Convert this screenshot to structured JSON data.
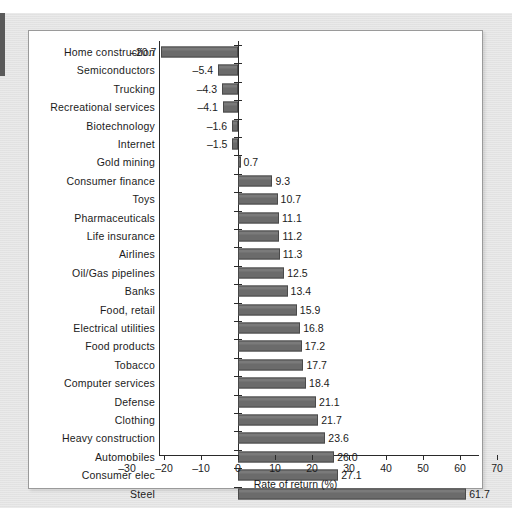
{
  "chart_data": {
    "type": "bar",
    "orientation": "horizontal",
    "title": "",
    "xlabel": "Rate of return (%)",
    "ylabel": "",
    "xlim": [
      -30,
      70
    ],
    "xticks": [
      -30,
      -20,
      -10,
      0,
      10,
      20,
      30,
      40,
      50,
      60,
      70
    ],
    "xtick_labels": [
      "–30",
      "–20",
      "–10",
      "0",
      "10",
      "20",
      "30",
      "40",
      "50",
      "60",
      "70"
    ],
    "grid": false,
    "legend": null,
    "bar_color": "#6b6b6b",
    "categories": [
      "Home construction",
      "Semiconductors",
      "Trucking",
      "Recreational services",
      "Biotechnology",
      "Internet",
      "Gold mining",
      "Consumer finance",
      "Toys",
      "Pharmaceuticals",
      "Life insurance",
      "Airlines",
      "Oil/Gas pipelines",
      "Banks",
      "Food, retail",
      "Electrical utilities",
      "Food products",
      "Tobacco",
      "Computer services",
      "Defense",
      "Clothing",
      "Heavy construction",
      "Automobiles",
      "Consumer elec",
      "Steel"
    ],
    "values": [
      -20.7,
      -5.4,
      -4.3,
      -4.1,
      -1.6,
      -1.5,
      0.7,
      9.3,
      10.7,
      11.1,
      11.2,
      11.3,
      12.5,
      13.4,
      15.9,
      16.8,
      17.2,
      17.7,
      18.4,
      21.1,
      21.7,
      23.6,
      26.0,
      27.1,
      61.7
    ],
    "value_labels": [
      "–20.7",
      "–5.4",
      "–4.3",
      "–4.1",
      "–1.6",
      "–1.5",
      "0.7",
      "9.3",
      "10.7",
      "11.1",
      "11.2",
      "11.3",
      "12.5",
      "13.4",
      "15.9",
      "16.8",
      "17.2",
      "17.7",
      "18.4",
      "21.1",
      "21.7",
      "23.6",
      "26.0",
      "27.1",
      "61.7"
    ]
  }
}
